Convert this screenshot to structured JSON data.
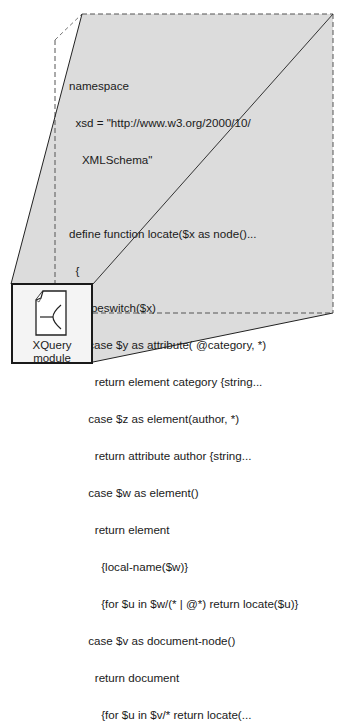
{
  "diagram": {
    "type": "zoom-expansion callout",
    "colors": {
      "panel_fill": "#dcdcdc",
      "dashed_stroke": "#555555",
      "solid_stroke": "#222222",
      "box_fill": "#f4f4f4",
      "text": "#1a1a1a"
    },
    "code_panel": {
      "lines": [
        "namespace",
        "  xsd = \"http://www.w3.org/2000/10/",
        "    XMLSchema\"",
        "",
        "define function locate($x as node()...",
        "  {",
        "    typeswitch($x)",
        "      case $y as attribute( @category, *)",
        "        return element category {string...",
        "      case $z as element(author, *)",
        "        return attribute author {string...",
        "      case $w as element()",
        "        return element",
        "          {local-name($w)}",
        "          {for $u in $w/(* | @*) return locate($u)}",
        "      case $v as document-node()",
        "        return document",
        "          {for $u in $v/* return locate(...",
        "    default return $x"
      ]
    },
    "module_box": {
      "icon": "xquery-document-icon",
      "label_line1": "XQuery",
      "label_line2": "module"
    }
  }
}
